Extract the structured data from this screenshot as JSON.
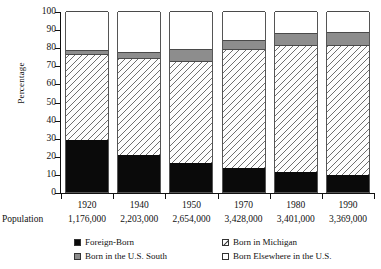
{
  "chart_data": {
    "type": "bar",
    "subtype": "stacked-bar-100-percent",
    "title": "",
    "xlabel": "",
    "ylabel": "Percentage",
    "ylim": [
      0,
      100
    ],
    "yticks": [
      0,
      10,
      20,
      30,
      40,
      50,
      60,
      70,
      80,
      90,
      100
    ],
    "grid": false,
    "legend_position": "bottom",
    "categories": [
      "1920",
      "1940",
      "1950",
      "1970",
      "1980",
      "1990"
    ],
    "series": [
      {
        "name": "Foreign-Born",
        "values": [
          29,
          20.5,
          16,
          13,
          11,
          9.5
        ]
      },
      {
        "name": "Born in Michigan",
        "values": [
          47,
          53.5,
          56.5,
          66,
          70,
          72
        ]
      },
      {
        "name": "Born in the U.S. South",
        "values": [
          2.5,
          3.5,
          6.5,
          5,
          7,
          7
        ]
      },
      {
        "name": "Born Elsewhere in the U.S.",
        "values": [
          21.5,
          22.5,
          21,
          16,
          12,
          11.5
        ]
      }
    ],
    "annotations": {
      "population_row_label": "Population",
      "population_values": [
        "1,176,000",
        "2,203,000",
        "2,654,000",
        "3,428,000",
        "3,401,000",
        "3,369,000"
      ]
    }
  },
  "legend": {
    "items": [
      {
        "label": "Foreign-Born",
        "swatch": "solid-black"
      },
      {
        "label": "Born in Michigan",
        "swatch": "diagonal-hatch"
      },
      {
        "label": "Born in the U.S. South",
        "swatch": "solid-gray"
      },
      {
        "label": "Born Elsewhere in the U.S.",
        "swatch": "white"
      }
    ]
  },
  "colors": {
    "foreign_born": "#0a0a0a",
    "born_in_michigan_hatch": "#6f6f6f",
    "born_in_us_south": "#8d8d8d",
    "born_elsewhere": "#ffffff",
    "axis": "#111111"
  }
}
